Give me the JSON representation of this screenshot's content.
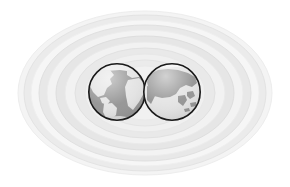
{
  "canvas": {
    "width": 290,
    "height": 187,
    "background": "#ffffff"
  },
  "graphic": {
    "title": "Two globes surrounded by concentric elliptical rings",
    "description": "Decorative world/global icon: a pair of overlapping hemisphere globes centered inside a halo of concentric light-grey ellipses on a white background."
  },
  "rings": {
    "name": "concentric-ellipse-halo",
    "center": {
      "cx": 145,
      "cy": 93
    },
    "count": 11,
    "items": [
      {
        "rx": 127,
        "ry": 82,
        "fill": "#f4f4f4",
        "stroke": "#ededed"
      },
      {
        "rx": 121,
        "ry": 78,
        "fill": "#ebebeb",
        "stroke": "#e3e3e3"
      },
      {
        "rx": 114,
        "ry": 73,
        "fill": "#f6f6f6",
        "stroke": "#efefef"
      },
      {
        "rx": 106,
        "ry": 68,
        "fill": "#e8e8e8",
        "stroke": "#e0e0e0"
      },
      {
        "rx": 98,
        "ry": 63,
        "fill": "#f3f3f3",
        "stroke": "#ececec"
      },
      {
        "rx": 89,
        "ry": 57,
        "fill": "#e6e6e6",
        "stroke": "#dedede"
      },
      {
        "rx": 80,
        "ry": 51,
        "fill": "#f2f2f2",
        "stroke": "#eaeaea"
      },
      {
        "rx": 70,
        "ry": 45,
        "fill": "#e9e9e9",
        "stroke": "#e1e1e1"
      },
      {
        "rx": 60,
        "ry": 39,
        "fill": "#f0f0f0",
        "stroke": "#e8e8e8"
      },
      {
        "rx": 49,
        "ry": 33,
        "fill": "#ebebeb",
        "stroke": "#e4e4e4"
      },
      {
        "rx": 38,
        "ry": 27,
        "fill": "#f1f1f1",
        "stroke": "#eaeaea"
      }
    ]
  },
  "globes": [
    {
      "id": "globe-left",
      "label": "Globe showing the Americas and Atlantic",
      "cx": 117,
      "cy": 92,
      "r": 29,
      "ocean_color": "#8f8f8f",
      "land_color": "#e2e2e2",
      "outline_color": "#1a1a1a",
      "highlight_color": "#f6f6f6"
    },
    {
      "id": "globe-right",
      "label": "Globe showing Eurasia and Asia",
      "cx": 172,
      "cy": 92,
      "r": 29,
      "ocean_color": "#e2e2e2",
      "land_color": "#8f8f8f",
      "outline_color": "#1a1a1a",
      "highlight_color": "#f8f8f8"
    }
  ],
  "palette": {
    "background": "#ffffff",
    "ring_light": "#f6f6f6",
    "ring_dark": "#e6e6e6",
    "globe_dark": "#8f8f8f",
    "globe_light": "#e2e2e2",
    "globe_outline": "#1a1a1a"
  }
}
